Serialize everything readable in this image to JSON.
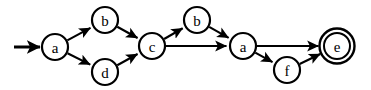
{
  "diagram": {
    "type": "finite-state-automaton",
    "background_color": "#ffffff",
    "stroke_color": "#000000",
    "width": 371,
    "height": 90,
    "nodes": [
      {
        "id": "n1",
        "label": "a",
        "cx": 55,
        "cy": 47,
        "r": 13,
        "accepting": false,
        "start": true
      },
      {
        "id": "n2",
        "label": "b",
        "cx": 105,
        "cy": 20,
        "r": 13,
        "accepting": false,
        "start": false
      },
      {
        "id": "n3",
        "label": "d",
        "cx": 105,
        "cy": 72,
        "r": 13,
        "accepting": false,
        "start": false
      },
      {
        "id": "n4",
        "label": "c",
        "cx": 152,
        "cy": 46,
        "r": 13,
        "accepting": false,
        "start": false
      },
      {
        "id": "n5",
        "label": "b",
        "cx": 197,
        "cy": 20,
        "r": 13,
        "accepting": false,
        "start": false
      },
      {
        "id": "n6",
        "label": "a",
        "cx": 243,
        "cy": 46,
        "r": 13,
        "accepting": false,
        "start": false
      },
      {
        "id": "n7",
        "label": "f",
        "cx": 287,
        "cy": 70,
        "r": 13,
        "accepting": false,
        "start": false
      },
      {
        "id": "n8",
        "label": "e",
        "cx": 337,
        "cy": 46,
        "r": 13,
        "accepting": true,
        "start": false
      }
    ],
    "edges": [
      {
        "from": "n1",
        "to": "n2",
        "label": ""
      },
      {
        "from": "n1",
        "to": "n3",
        "label": ""
      },
      {
        "from": "n2",
        "to": "n4",
        "label": ""
      },
      {
        "from": "n3",
        "to": "n4",
        "label": ""
      },
      {
        "from": "n4",
        "to": "n5",
        "label": ""
      },
      {
        "from": "n4",
        "to": "n6",
        "label": ""
      },
      {
        "from": "n5",
        "to": "n6",
        "label": ""
      },
      {
        "from": "n6",
        "to": "n8",
        "label": ""
      },
      {
        "from": "n6",
        "to": "n7",
        "label": ""
      },
      {
        "from": "n7",
        "to": "n8",
        "label": ""
      }
    ],
    "start_marker": {
      "x1": 14,
      "y1": 47,
      "x2": 40,
      "y2": 47
    }
  }
}
